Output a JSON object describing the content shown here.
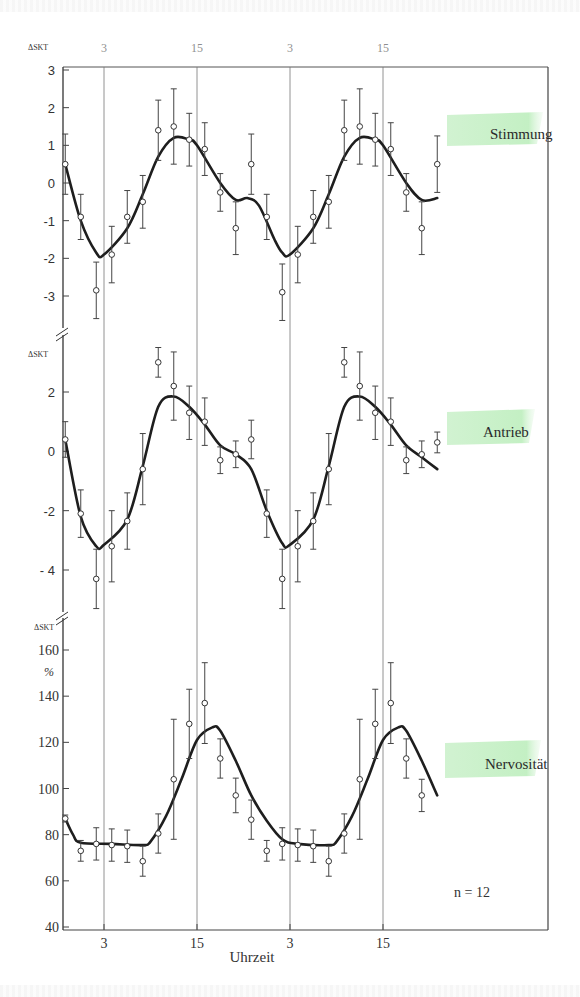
{
  "chart_data": {
    "type": "line",
    "title": "",
    "xlabel": "Uhrzeit",
    "x_tick_labels": [
      "3",
      "15",
      "3",
      "15"
    ],
    "x_ticks_hours": [
      3,
      15,
      27,
      39
    ],
    "x_hours": [
      -2,
      0,
      2,
      4,
      6,
      8,
      10,
      12,
      14,
      16,
      18,
      20,
      22,
      24,
      26,
      28,
      30,
      32,
      34,
      36,
      38,
      40,
      42,
      44,
      46
    ],
    "footnote": "n = 12",
    "panels": [
      {
        "name": "Stimmung",
        "ylabel": "ΔSKT",
        "ylim": [
          -3.7,
          3
        ],
        "y_ticks": [
          3,
          2,
          1,
          0,
          -1,
          -2,
          -3
        ],
        "y_tick_labels": [
          "3",
          "2",
          "1",
          "0",
          "-1",
          "-2",
          "-3"
        ],
        "points": [
          0.5,
          -0.9,
          -2.85,
          -1.9,
          -0.9,
          -0.5,
          1.4,
          1.5,
          1.15,
          0.9,
          -0.25,
          -1.2,
          0.5,
          -0.9,
          -2.9,
          -1.9,
          -0.9,
          -0.5,
          1.4,
          1.5,
          1.15,
          0.9,
          -0.25,
          -1.2,
          0.5
        ],
        "errors": [
          0.8,
          0.6,
          0.75,
          0.75,
          0.7,
          0.7,
          0.8,
          1.0,
          0.7,
          0.7,
          0.5,
          0.7,
          0.8,
          0.6,
          0.75,
          0.75,
          0.7,
          0.7,
          0.8,
          1.0,
          0.7,
          0.7,
          0.5,
          0.7,
          0.75
        ],
        "curve": [
          [
            -2,
            0.5
          ],
          [
            0,
            -1.0
          ],
          [
            2,
            -1.85
          ],
          [
            3,
            -1.9
          ],
          [
            6,
            -1.2
          ],
          [
            8,
            -0.3
          ],
          [
            10,
            0.7
          ],
          [
            12,
            1.2
          ],
          [
            14,
            1.15
          ],
          [
            15,
            1.0
          ],
          [
            18,
            0.0
          ],
          [
            20,
            -0.45
          ],
          [
            21.5,
            -0.4
          ],
          [
            23,
            -0.6
          ],
          [
            25,
            -1.5
          ],
          [
            26,
            -1.85
          ],
          [
            27,
            -1.9
          ],
          [
            30,
            -1.2
          ],
          [
            32,
            -0.3
          ],
          [
            34,
            0.7
          ],
          [
            36,
            1.2
          ],
          [
            38,
            1.15
          ],
          [
            39,
            1.0
          ],
          [
            42,
            0.0
          ],
          [
            44,
            -0.45
          ],
          [
            46,
            -0.4
          ]
        ]
      },
      {
        "name": "Antrieb",
        "ylabel": "ΔSKT",
        "ylim": [
          -5.3,
          3.5
        ],
        "y_ticks": [
          2,
          0,
          -2,
          -4
        ],
        "y_tick_labels": [
          "2",
          "0",
          "-2",
          "- 4"
        ],
        "points": [
          0.4,
          -2.1,
          -4.3,
          -3.2,
          -2.35,
          -0.6,
          3.0,
          2.2,
          1.3,
          1.0,
          -0.3,
          -0.1,
          0.4,
          -2.1,
          -4.3,
          -3.2,
          -2.35,
          -0.6,
          3.0,
          2.2,
          1.3,
          1.0,
          -0.3,
          -0.1,
          0.3
        ],
        "errors": [
          0.6,
          0.8,
          1.0,
          1.2,
          0.95,
          1.2,
          0.5,
          1.15,
          0.9,
          0.8,
          0.45,
          0.45,
          0.65,
          0.8,
          1.0,
          1.2,
          0.95,
          1.2,
          0.5,
          1.15,
          0.9,
          0.8,
          0.45,
          0.45,
          0.35
        ],
        "curve": [
          [
            -2,
            0.4
          ],
          [
            0,
            -2.2
          ],
          [
            2,
            -3.2
          ],
          [
            3,
            -3.15
          ],
          [
            6,
            -2.3
          ],
          [
            8,
            -0.5
          ],
          [
            10,
            1.5
          ],
          [
            12,
            1.85
          ],
          [
            14,
            1.5
          ],
          [
            16,
            0.9
          ],
          [
            18,
            0.2
          ],
          [
            20,
            -0.1
          ],
          [
            22,
            -0.6
          ],
          [
            24,
            -2.0
          ],
          [
            26,
            -3.1
          ],
          [
            27,
            -3.15
          ],
          [
            30,
            -2.3
          ],
          [
            32,
            -0.5
          ],
          [
            34,
            1.5
          ],
          [
            36,
            1.85
          ],
          [
            38,
            1.5
          ],
          [
            40,
            0.9
          ],
          [
            42,
            0.2
          ],
          [
            44,
            -0.2
          ],
          [
            46,
            -0.6
          ]
        ]
      },
      {
        "name": "Nervosität",
        "ylabel": "ΔSKT",
        "ylabel2": "%",
        "ylim": [
          40,
          165
        ],
        "y_ticks": [
          160,
          140,
          120,
          100,
          80,
          60,
          40
        ],
        "y_tick_labels": [
          "160",
          "140",
          "120",
          "100",
          "80",
          "60",
          "40"
        ],
        "points": [
          87,
          73,
          76,
          75.5,
          75,
          68.5,
          80.5,
          104,
          128,
          137,
          113,
          97,
          86.5,
          73,
          76,
          75.5,
          75,
          68.5,
          80.5,
          104,
          128,
          137,
          113,
          97
        ],
        "errors": [
          1.5,
          4.5,
          7,
          7,
          7,
          6.5,
          8.5,
          26,
          15,
          17.5,
          8.5,
          7.5,
          8.5,
          4.5,
          7,
          7,
          7,
          6.5,
          8.5,
          26,
          15,
          17.5,
          8.5,
          7
        ],
        "curve": [
          [
            -2,
            87
          ],
          [
            -1,
            80
          ],
          [
            0,
            76.5
          ],
          [
            4,
            76
          ],
          [
            8,
            75.5
          ],
          [
            9,
            77
          ],
          [
            11,
            88
          ],
          [
            13,
            104
          ],
          [
            15,
            121
          ],
          [
            17,
            126.5
          ],
          [
            18,
            125
          ],
          [
            20,
            112
          ],
          [
            22,
            97
          ],
          [
            24,
            86
          ],
          [
            26,
            78
          ],
          [
            28,
            76
          ],
          [
            32,
            75.5
          ],
          [
            33,
            77
          ],
          [
            35,
            88
          ],
          [
            37,
            104
          ],
          [
            39,
            121
          ],
          [
            41,
            126.5
          ],
          [
            42,
            125
          ],
          [
            44,
            112
          ],
          [
            46,
            97
          ]
        ]
      }
    ]
  }
}
